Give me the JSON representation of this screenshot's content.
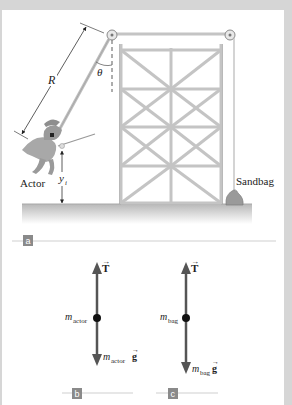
{
  "figure": {
    "panel_a": {
      "tag": "a",
      "labels": {
        "rope_length": "R",
        "angle": "θ",
        "actor": "Actor",
        "height": "y",
        "height_subscript": "i",
        "sandbag": "Sandbag"
      }
    },
    "panel_b": {
      "tag": "b",
      "tension_label": "T",
      "mass_label": "m",
      "mass_subscript": "actor",
      "weight_mass": "m",
      "weight_subscript": "actor",
      "weight_g": "g"
    },
    "panel_c": {
      "tag": "c",
      "tension_label": "T",
      "mass_label": "m",
      "mass_subscript": "bag",
      "weight_mass": "m",
      "weight_subscript": "bag",
      "weight_g": "g"
    },
    "colors": {
      "frame": "#d6d6d6",
      "background": "#ffffff",
      "tower": "#c8c8c8",
      "ground": "#bdbdbd",
      "vector": "#555555",
      "tag": "#8a8a8a"
    }
  }
}
